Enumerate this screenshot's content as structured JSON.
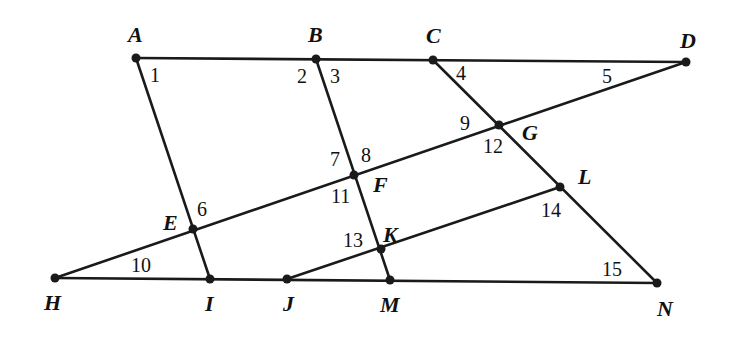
{
  "diagram": {
    "points": [
      {
        "name": "A",
        "x": 136,
        "y": 58,
        "lx": 128,
        "ly": 42
      },
      {
        "name": "B",
        "x": 316,
        "y": 59,
        "lx": 308,
        "ly": 42
      },
      {
        "name": "C",
        "x": 433,
        "y": 60,
        "lx": 426,
        "ly": 43
      },
      {
        "name": "D",
        "x": 686,
        "y": 62,
        "lx": 680,
        "ly": 48
      },
      {
        "name": "G",
        "x": 499,
        "y": 125,
        "lx": 522,
        "ly": 140
      },
      {
        "name": "F",
        "x": 354,
        "y": 175,
        "lx": 373,
        "ly": 192
      },
      {
        "name": "E",
        "x": 193,
        "y": 229,
        "lx": 163,
        "ly": 230
      },
      {
        "name": "L",
        "x": 560,
        "y": 187,
        "lx": 578,
        "ly": 184
      },
      {
        "name": "K",
        "x": 381,
        "y": 249,
        "lx": 383,
        "ly": 242
      },
      {
        "name": "H",
        "x": 55,
        "y": 278,
        "lx": 44,
        "ly": 310
      },
      {
        "name": "I",
        "x": 210,
        "y": 279,
        "lx": 205,
        "ly": 311
      },
      {
        "name": "J",
        "x": 287,
        "y": 279,
        "lx": 283,
        "ly": 311
      },
      {
        "name": "M",
        "x": 390,
        "y": 280,
        "lx": 380,
        "ly": 312
      },
      {
        "name": "N",
        "x": 657,
        "y": 283,
        "lx": 657,
        "ly": 316
      }
    ],
    "segments": [
      {
        "from": "A",
        "to": "D"
      },
      {
        "from": "H",
        "to": "N"
      },
      {
        "from": "H",
        "to": "D"
      },
      {
        "from": "J",
        "to": "L"
      },
      {
        "from": "A",
        "to": "I"
      },
      {
        "from": "B",
        "to": "M"
      },
      {
        "from": "C",
        "to": "N"
      }
    ],
    "angles": [
      {
        "label": "1",
        "x": 150,
        "y": 82
      },
      {
        "label": "2",
        "x": 297,
        "y": 83
      },
      {
        "label": "3",
        "x": 330,
        "y": 83
      },
      {
        "label": "4",
        "x": 456,
        "y": 80
      },
      {
        "label": "5",
        "x": 602,
        "y": 83
      },
      {
        "label": "6",
        "x": 197,
        "y": 216
      },
      {
        "label": "7",
        "x": 330,
        "y": 166
      },
      {
        "label": "8",
        "x": 361,
        "y": 162
      },
      {
        "label": "9",
        "x": 460,
        "y": 130
      },
      {
        "label": "10",
        "x": 131,
        "y": 272
      },
      {
        "label": "11",
        "x": 331,
        "y": 203
      },
      {
        "label": "12",
        "x": 483,
        "y": 153
      },
      {
        "label": "13",
        "x": 343,
        "y": 247
      },
      {
        "label": "14",
        "x": 541,
        "y": 217
      },
      {
        "label": "15",
        "x": 602,
        "y": 276
      }
    ]
  }
}
